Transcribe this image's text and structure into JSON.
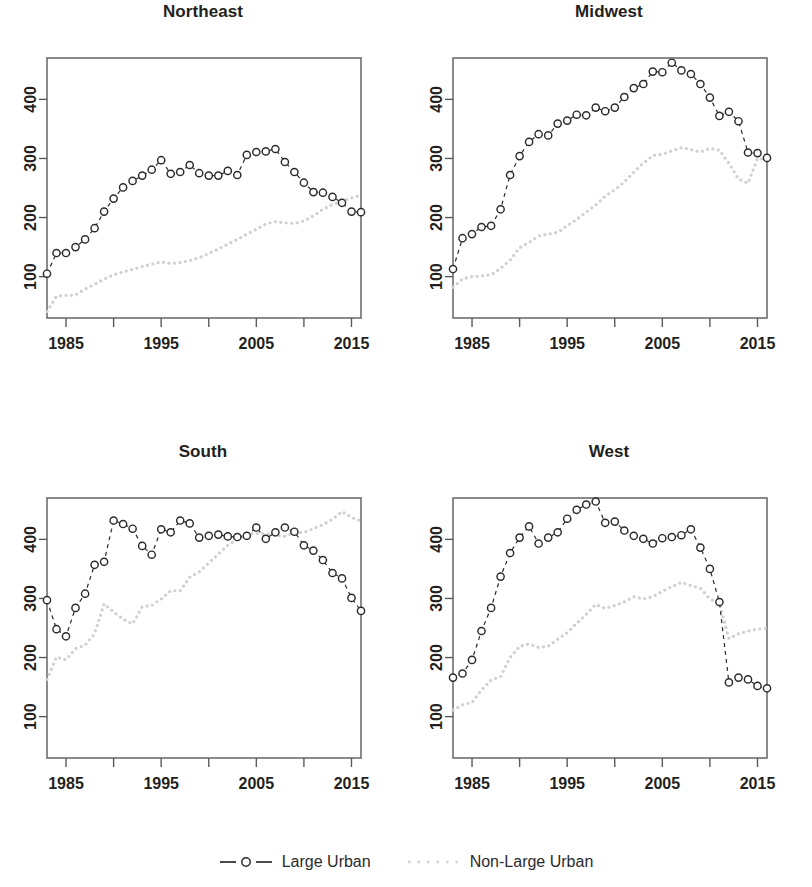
{
  "figure": {
    "panels": [
      "Northeast",
      "Midwest",
      "South",
      "West"
    ],
    "legend": [
      {
        "label": "Large Urban",
        "key": "line-circle-dashed-dark",
        "color": "#2b2b2b"
      },
      {
        "label": "Non-Large Urban",
        "key": "line-dotted-light",
        "color": "#d0d0d0"
      }
    ]
  },
  "chart_data": [
    {
      "type": "line",
      "title": "Northeast",
      "xlabel": "",
      "ylabel": "",
      "xlim": [
        1983,
        2016
      ],
      "ylim": [
        30,
        470
      ],
      "yticks": [
        100,
        200,
        300,
        400
      ],
      "xticks": [
        1985,
        1990,
        1995,
        2000,
        2005,
        2010,
        2015
      ],
      "xticklabels": [
        "1985",
        "",
        "1995",
        "",
        "2005",
        "",
        "2015"
      ],
      "grid": false,
      "legend_position": "bottom",
      "x": [
        1983,
        1984,
        1985,
        1986,
        1987,
        1988,
        1989,
        1990,
        1991,
        1992,
        1993,
        1994,
        1995,
        1996,
        1997,
        1998,
        1999,
        2000,
        2001,
        2002,
        2003,
        2004,
        2005,
        2006,
        2007,
        2008,
        2009,
        2010,
        2011,
        2012,
        2013,
        2014,
        2015,
        2016
      ],
      "series": [
        {
          "name": "Large Urban",
          "style": "dashed-open-circles",
          "color": "#2b2b2b",
          "values": [
            105,
            140,
            140,
            150,
            163,
            182,
            210,
            232,
            251,
            262,
            271,
            281,
            297,
            274,
            277,
            289,
            275,
            271,
            271,
            279,
            272,
            306,
            311,
            312,
            316,
            294,
            277,
            259,
            243,
            242,
            235,
            225,
            210,
            209
          ]
        },
        {
          "name": "Non-Large Urban",
          "style": "dotted",
          "color": "#d0d0d0",
          "values": [
            41,
            67,
            68,
            69,
            79,
            87,
            96,
            103,
            108,
            112,
            117,
            121,
            125,
            122,
            124,
            127,
            132,
            139,
            147,
            155,
            163,
            172,
            180,
            189,
            193,
            191,
            190,
            194,
            203,
            214,
            222,
            228,
            233,
            238
          ]
        }
      ]
    },
    {
      "type": "line",
      "title": "Midwest",
      "xlabel": "",
      "ylabel": "",
      "xlim": [
        1983,
        2016
      ],
      "ylim": [
        30,
        470
      ],
      "yticks": [
        100,
        200,
        300,
        400
      ],
      "xticks": [
        1985,
        1990,
        1995,
        2000,
        2005,
        2010,
        2015
      ],
      "xticklabels": [
        "1985",
        "",
        "1995",
        "",
        "2005",
        "",
        "2015"
      ],
      "grid": false,
      "legend_position": "bottom",
      "x": [
        1983,
        1984,
        1985,
        1986,
        1987,
        1988,
        1989,
        1990,
        1991,
        1992,
        1993,
        1994,
        1995,
        1996,
        1997,
        1998,
        1999,
        2000,
        2001,
        2002,
        2003,
        2004,
        2005,
        2006,
        2007,
        2008,
        2009,
        2010,
        2011,
        2012,
        2013,
        2014,
        2015,
        2016
      ],
      "series": [
        {
          "name": "Large Urban",
          "style": "dashed-open-circles",
          "color": "#2b2b2b",
          "values": [
            113,
            165,
            172,
            184,
            186,
            214,
            272,
            304,
            328,
            341,
            339,
            359,
            364,
            374,
            373,
            386,
            380,
            386,
            404,
            419,
            426,
            447,
            446,
            462,
            449,
            443,
            426,
            403,
            372,
            379,
            363,
            310,
            309,
            301
          ]
        },
        {
          "name": "Non-Large Urban",
          "style": "dotted",
          "color": "#d0d0d0",
          "values": [
            82,
            96,
            100,
            101,
            103,
            114,
            128,
            149,
            158,
            169,
            172,
            175,
            186,
            197,
            209,
            221,
            236,
            247,
            260,
            277,
            292,
            305,
            307,
            313,
            318,
            315,
            311,
            317,
            314,
            292,
            265,
            258,
            300,
            298
          ]
        }
      ]
    },
    {
      "type": "line",
      "title": "South",
      "xlabel": "",
      "ylabel": "",
      "xlim": [
        1983,
        2016
      ],
      "ylim": [
        30,
        470
      ],
      "yticks": [
        100,
        200,
        300,
        400
      ],
      "xticks": [
        1985,
        1990,
        1995,
        2000,
        2005,
        2010,
        2015
      ],
      "xticklabels": [
        "1985",
        "",
        "1995",
        "",
        "2005",
        "",
        "2015"
      ],
      "grid": false,
      "legend_position": "bottom",
      "x": [
        1983,
        1984,
        1985,
        1986,
        1987,
        1988,
        1989,
        1990,
        1991,
        1992,
        1993,
        1994,
        1995,
        1996,
        1997,
        1998,
        1999,
        2000,
        2001,
        2002,
        2003,
        2004,
        2005,
        2006,
        2007,
        2008,
        2009,
        2010,
        2011,
        2012,
        2013,
        2014,
        2015,
        2016
      ],
      "series": [
        {
          "name": "Large Urban",
          "style": "dashed-open-circles",
          "color": "#2b2b2b",
          "values": [
            297,
            248,
            236,
            284,
            308,
            357,
            362,
            432,
            426,
            418,
            389,
            374,
            417,
            412,
            432,
            427,
            403,
            406,
            408,
            405,
            404,
            406,
            420,
            401,
            412,
            420,
            413,
            390,
            381,
            365,
            343,
            334,
            301,
            279
          ]
        },
        {
          "name": "Non-Large Urban",
          "style": "dotted",
          "color": "#d0d0d0",
          "values": [
            163,
            201,
            196,
            215,
            221,
            240,
            291,
            277,
            265,
            257,
            286,
            288,
            299,
            313,
            313,
            336,
            345,
            360,
            375,
            390,
            400,
            409,
            410,
            410,
            407,
            405,
            411,
            412,
            418,
            425,
            434,
            447,
            437,
            431
          ]
        }
      ]
    },
    {
      "type": "line",
      "title": "West",
      "xlabel": "",
      "ylabel": "",
      "xlim": [
        1983,
        2016
      ],
      "ylim": [
        30,
        470
      ],
      "yticks": [
        100,
        200,
        300,
        400
      ],
      "xticks": [
        1985,
        1990,
        1995,
        2000,
        2005,
        2010,
        2015
      ],
      "xticklabels": [
        "1985",
        "",
        "1995",
        "",
        "2005",
        "",
        "2015"
      ],
      "grid": false,
      "legend_position": "bottom",
      "x": [
        1983,
        1984,
        1985,
        1986,
        1987,
        1988,
        1989,
        1990,
        1991,
        1992,
        1993,
        1994,
        1995,
        1996,
        1997,
        1998,
        1999,
        2000,
        2001,
        2002,
        2003,
        2004,
        2005,
        2006,
        2007,
        2008,
        2009,
        2010,
        2011,
        2012,
        2013,
        2014,
        2015,
        2016
      ],
      "series": [
        {
          "name": "Large Urban",
          "style": "dashed-open-circles",
          "color": "#2b2b2b",
          "values": [
            166,
            173,
            196,
            245,
            284,
            337,
            377,
            403,
            422,
            393,
            403,
            412,
            435,
            450,
            459,
            464,
            428,
            430,
            415,
            406,
            401,
            393,
            402,
            404,
            407,
            417,
            386,
            350,
            294,
            158,
            166,
            163,
            152,
            148
          ]
        },
        {
          "name": "Non-Large Urban",
          "style": "dotted",
          "color": "#d0d0d0",
          "values": [
            111,
            120,
            124,
            145,
            162,
            168,
            200,
            219,
            223,
            217,
            219,
            231,
            242,
            258,
            273,
            290,
            283,
            288,
            294,
            303,
            299,
            303,
            312,
            320,
            327,
            322,
            317,
            299,
            292,
            232,
            240,
            245,
            248,
            249
          ]
        }
      ]
    }
  ]
}
